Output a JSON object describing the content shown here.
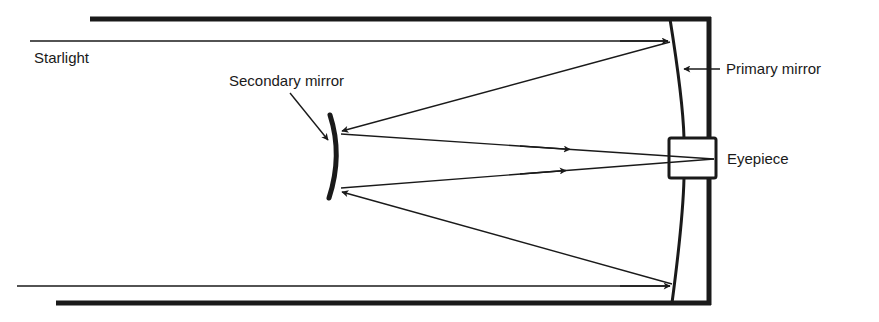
{
  "diagram": {
    "type": "Cassegrain reflecting telescope",
    "labels": {
      "starlight": "Starlight",
      "secondary_mirror": "Secondary mirror",
      "primary_mirror": "Primary mirror",
      "eyepiece": "Eyepiece"
    },
    "colors": {
      "ink": "#1a1a1a",
      "background": "#ffffff"
    }
  }
}
